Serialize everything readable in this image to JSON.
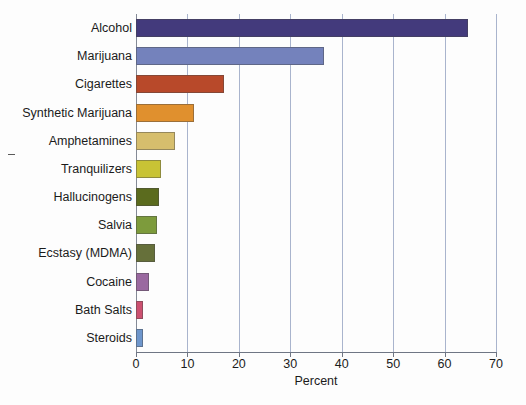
{
  "chart_data": {
    "type": "bar",
    "orientation": "horizontal",
    "title": "",
    "xlabel": "Percent",
    "ylabel": "",
    "xlim": [
      0,
      70
    ],
    "xticks": [
      0,
      10,
      20,
      30,
      40,
      50,
      60,
      70
    ],
    "grid": true,
    "legend": false,
    "categories": [
      "Alcohol",
      "Marijuana",
      "Cigarettes",
      "Synthetic Marijuana",
      "Amphetamines",
      "Tranquilizers",
      "Hallucinogens",
      "Salvia",
      "Ecstasy (MDMA)",
      "Cocaine",
      "Bath Salts",
      "Steroids"
    ],
    "values": [
      64.6,
      36.6,
      17.1,
      11.3,
      7.6,
      4.9,
      4.5,
      4.1,
      3.7,
      2.5,
      1.3,
      1.3
    ],
    "colors": [
      "#433A7C",
      "#7482BC",
      "#B8492A",
      "#E0902E",
      "#D6BE6D",
      "#C8C335",
      "#5B6B1E",
      "#7D9B3C",
      "#66703A",
      "#9A69A0",
      "#CC5070",
      "#6E96CC"
    ],
    "grid_color": "#9aa7c4",
    "axis_color": "#6f7684",
    "background": "#fdfdfd"
  }
}
